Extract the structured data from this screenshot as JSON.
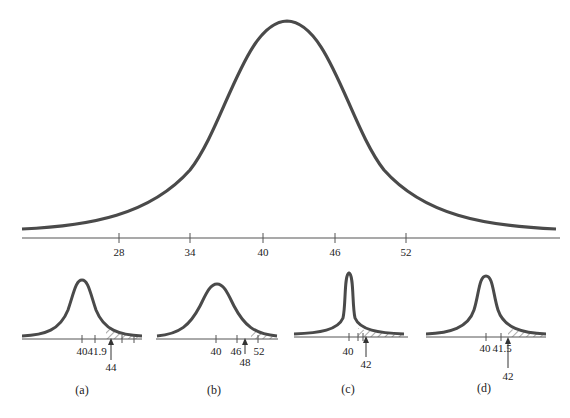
{
  "main": {
    "axis_ticks": [
      {
        "value": "28",
        "x": 119
      },
      {
        "value": "34",
        "x": 190
      },
      {
        "value": "40",
        "x": 263
      },
      {
        "value": "46",
        "x": 335
      },
      {
        "value": "52",
        "x": 406
      }
    ]
  },
  "panels": [
    {
      "id": "a",
      "caption": "(a)",
      "ticks": [
        "40",
        "41.9"
      ],
      "arrow_label": "44"
    },
    {
      "id": "b",
      "caption": "(b)",
      "ticks": [
        "40",
        "46",
        "52"
      ],
      "arrow_label": "48"
    },
    {
      "id": "c",
      "caption": "(c)",
      "ticks": [
        "40"
      ],
      "arrow_label": "42"
    },
    {
      "id": "d",
      "caption": "(d)",
      "ticks": [
        "40",
        "41.5"
      ],
      "arrow_label": "42"
    }
  ],
  "colors": {
    "curve": "#4a4a4a",
    "axis": "#555555",
    "text": "#222222"
  }
}
